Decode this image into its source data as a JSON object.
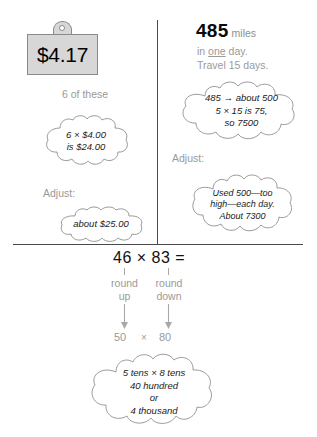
{
  "left_panel": {
    "price_tag": {
      "value": "$4.17",
      "icon": "price-tag-icon"
    },
    "quantity_note": "6 of these",
    "estimate_cloud": {
      "lines": [
        "6 × $4.00",
        "is $24.00"
      ]
    },
    "adjust_label": "Adjust:",
    "adjust_cloud": {
      "lines": [
        "about $25.00"
      ]
    }
  },
  "right_panel": {
    "headline": {
      "number": "485",
      "unit": "miles"
    },
    "context_lines": [
      "in one day.",
      "Travel 15 days."
    ],
    "context_underlined_word": "one",
    "estimate_cloud": {
      "lines": [
        "485 → about 500",
        "5 × 15 is 75,",
        "so 7500"
      ]
    },
    "adjust_label": "Adjust:",
    "adjust_cloud": {
      "lines": [
        "Used 500—too",
        "high—each day.",
        "About 7300"
      ]
    }
  },
  "bottom_panel": {
    "expression": "46 × 83 =",
    "round_up_label": [
      "round",
      "up"
    ],
    "round_down_label": [
      "round",
      "down"
    ],
    "rounded_expression": {
      "left": "50",
      "operator": "×",
      "right": "80"
    },
    "result_cloud": {
      "lines": [
        "5 tens × 8 tens",
        "40 hundred",
        "or",
        "4 thousand"
      ]
    }
  },
  "colors": {
    "background": "#ffffff",
    "divider": "#4a4a4a",
    "muted_text": "#9a9a9a",
    "dark_text": "#111111",
    "tag_fill": "#d7d7d7",
    "tag_stroke": "#8a8a8a",
    "cloud_stroke": "#8f8f8f",
    "cloud_fill": "#ffffff",
    "arrow": "#a8a8a8"
  }
}
